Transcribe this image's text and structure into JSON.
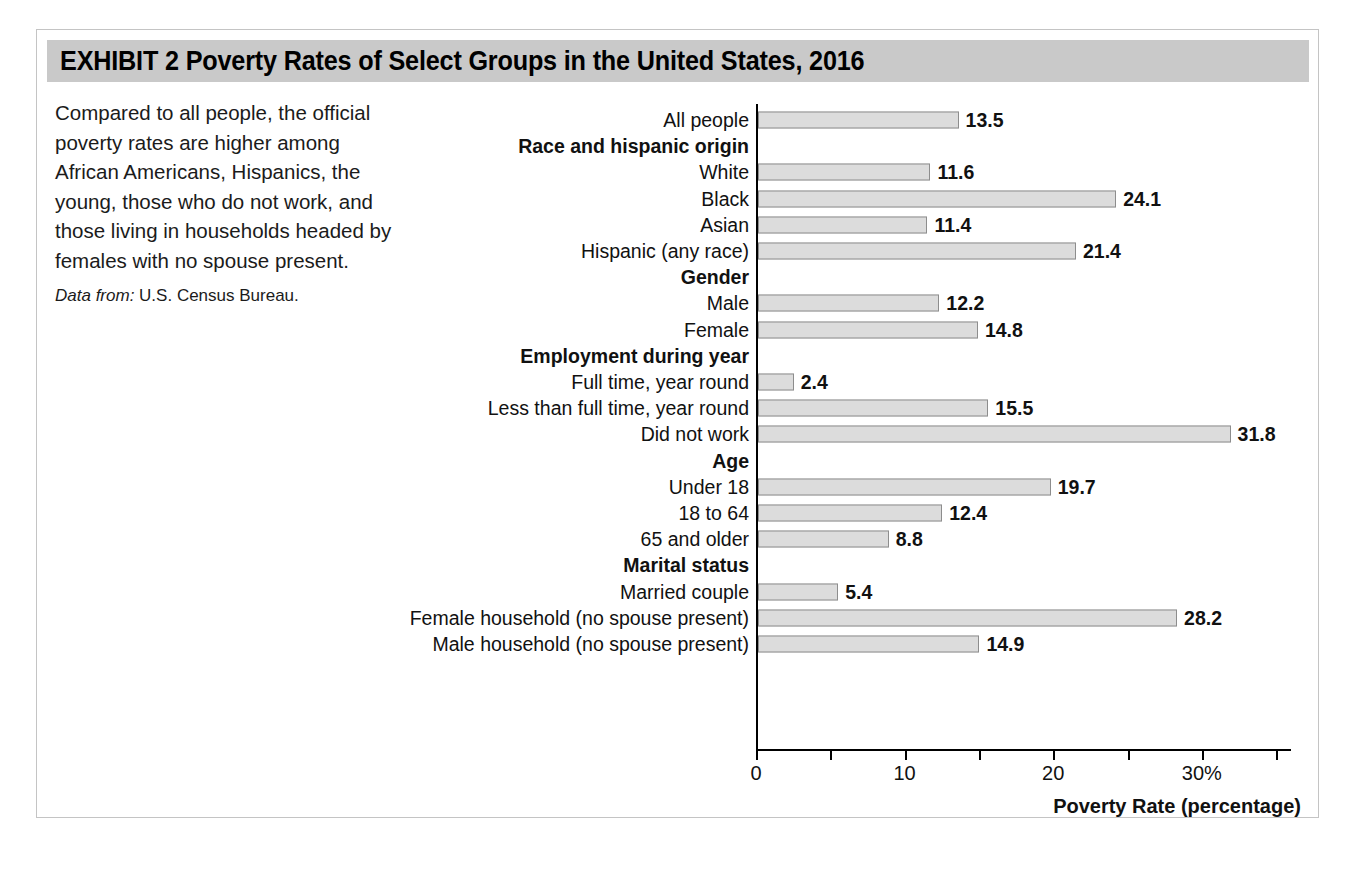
{
  "exhibit": {
    "title": "EXHIBIT 2   Poverty Rates of Select Groups in the United States, 2016",
    "caption": "Compared to all people, the official poverty rates are higher among African Americans, Hispanics, the young, those who do not work, and those living in households headed by females with no spouse present.",
    "source_label": "Data from:",
    "source_text": "U.S. Census Bureau.",
    "header_color": "#c9c9c9",
    "bar_fill": "#dcdcdc",
    "bar_stroke": "#8d8d8d"
  },
  "chart_data": {
    "type": "bar",
    "orientation": "horizontal",
    "title": "Poverty Rates of Select Groups in the United States, 2016",
    "xlabel": "Poverty Rate (percentage)",
    "ylabel": "",
    "xlim": [
      0,
      36
    ],
    "grid": false,
    "legend": null,
    "tick_values": [
      0,
      5,
      10,
      15,
      20,
      25,
      30,
      35
    ],
    "tick_labels": [
      "0",
      "",
      "10",
      "",
      "20",
      "",
      "30%",
      ""
    ],
    "source": "U.S. Census Bureau",
    "rows": [
      {
        "label": "All people",
        "value": 13.5,
        "is_group": false
      },
      {
        "label": "Race and hispanic origin",
        "value": null,
        "is_group": true
      },
      {
        "label": "White",
        "value": 11.6,
        "is_group": false
      },
      {
        "label": "Black",
        "value": 24.1,
        "is_group": false
      },
      {
        "label": "Asian",
        "value": 11.4,
        "is_group": false
      },
      {
        "label": "Hispanic (any race)",
        "value": 21.4,
        "is_group": false
      },
      {
        "label": "Gender",
        "value": null,
        "is_group": true
      },
      {
        "label": "Male",
        "value": 12.2,
        "is_group": false
      },
      {
        "label": "Female",
        "value": 14.8,
        "is_group": false
      },
      {
        "label": "Employment during year",
        "value": null,
        "is_group": true
      },
      {
        "label": "Full time, year round",
        "value": 2.4,
        "is_group": false
      },
      {
        "label": "Less than full time, year round",
        "value": 15.5,
        "is_group": false
      },
      {
        "label": "Did not work",
        "value": 31.8,
        "is_group": false
      },
      {
        "label": "Age",
        "value": null,
        "is_group": true
      },
      {
        "label": "Under 18",
        "value": 19.7,
        "is_group": false
      },
      {
        "label": "18 to 64",
        "value": 12.4,
        "is_group": false
      },
      {
        "label": "65 and older",
        "value": 8.8,
        "is_group": false
      },
      {
        "label": "Marital status",
        "value": null,
        "is_group": true
      },
      {
        "label": "Married couple",
        "value": 5.4,
        "is_group": false
      },
      {
        "label": "Female household (no spouse present)",
        "value": 28.2,
        "is_group": false
      },
      {
        "label": "Male household (no spouse present)",
        "value": 14.9,
        "is_group": false
      }
    ],
    "categories": [
      "All people",
      "White",
      "Black",
      "Asian",
      "Hispanic (any race)",
      "Male",
      "Female",
      "Full time, year round",
      "Less than full time, year round",
      "Did not work",
      "Under 18",
      "18 to 64",
      "65 and older",
      "Married couple",
      "Female household (no spouse present)",
      "Male household (no spouse present)"
    ],
    "values": [
      13.5,
      11.6,
      24.1,
      11.4,
      21.4,
      12.2,
      14.8,
      2.4,
      15.5,
      31.8,
      19.7,
      12.4,
      8.8,
      5.4,
      28.2,
      14.9
    ]
  }
}
